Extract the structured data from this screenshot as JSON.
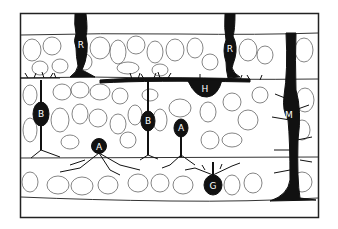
{
  "diagram": {
    "colors": {
      "ink": "#111111",
      "outline": "#555555",
      "background": "#ffffff"
    },
    "labels": [
      {
        "id": "R1",
        "text": "R",
        "cell": "rod"
      },
      {
        "id": "R2",
        "text": "R",
        "cell": "rod"
      },
      {
        "id": "B1",
        "text": "B",
        "cell": "bipolar"
      },
      {
        "id": "B2",
        "text": "B",
        "cell": "bipolar"
      },
      {
        "id": "H",
        "text": "H",
        "cell": "horizontal"
      },
      {
        "id": "A1",
        "text": "A",
        "cell": "amacrine"
      },
      {
        "id": "A2",
        "text": "A",
        "cell": "amacrine"
      },
      {
        "id": "G",
        "text": "G",
        "cell": "ganglion"
      },
      {
        "id": "M",
        "text": "M",
        "cell": "muller"
      }
    ]
  }
}
